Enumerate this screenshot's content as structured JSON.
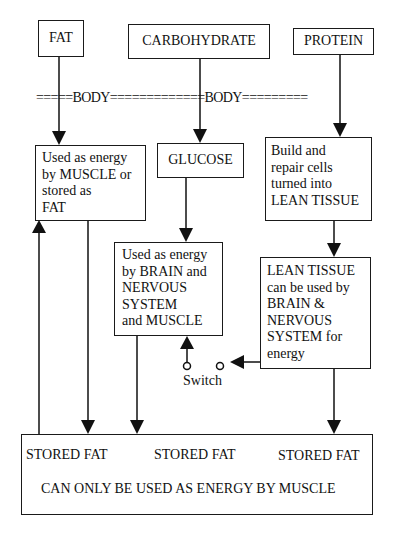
{
  "diagram": {
    "sources": {
      "fat": "FAT",
      "carbohydrate": "CARBOHYDRATE",
      "protein": "PROTEIN"
    },
    "body_line": "=====BODY=============BODY=========",
    "fat_use": "Used as energy\nby MUSCLE or\nstored as\nFAT",
    "glucose": "GLUCOSE",
    "protein_use": "Build and\nrepair cells\nturned into\nLEAN TISSUE",
    "glucose_use": "Used as energy\nby BRAIN and\nNERVOUS\nSYSTEM\nand MUSCLE",
    "lean_tissue_use": "LEAN TISSUE\ncan be used by\nBRAIN &\nNERVOUS\nSYSTEM for\nenergy",
    "switch_label": "Switch",
    "stored_fat": {
      "left": "STORED FAT",
      "middle": "STORED FAT",
      "right": "STORED FAT",
      "note": "CAN ONLY BE USED AS ENERGY BY MUSCLE"
    }
  }
}
